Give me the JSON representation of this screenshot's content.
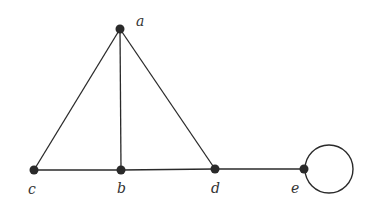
{
  "graph": {
    "nodes": [
      {
        "id": "a",
        "label": "a",
        "x": 120,
        "y": 29,
        "lx": 138,
        "ly": 24
      },
      {
        "id": "b",
        "label": "b",
        "x": 121,
        "y": 170,
        "lx": 117,
        "ly": 193
      },
      {
        "id": "c",
        "label": "c",
        "x": 34,
        "y": 170,
        "lx": 28,
        "ly": 193
      },
      {
        "id": "d",
        "label": "d",
        "x": 215,
        "y": 169,
        "lx": 211,
        "ly": 192
      },
      {
        "id": "e",
        "label": "e",
        "x": 304,
        "y": 169,
        "lx": 292,
        "ly": 192
      }
    ],
    "edges": [
      [
        "a",
        "c"
      ],
      [
        "a",
        "b"
      ],
      [
        "a",
        "d"
      ],
      [
        "c",
        "b"
      ],
      [
        "b",
        "d"
      ],
      [
        "d",
        "e"
      ]
    ],
    "loops": [
      {
        "node": "e",
        "cx": 329,
        "cy": 169,
        "r": 24
      }
    ],
    "colors": {
      "stroke": "#2a2a2a",
      "node": "#2a2a2a",
      "label": "#333333"
    }
  }
}
